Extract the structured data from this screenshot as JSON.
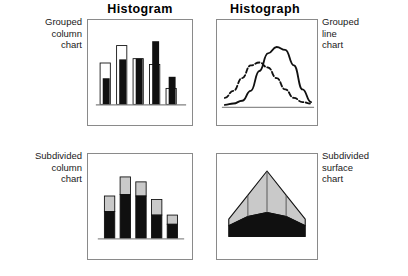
{
  "figure": {
    "headers": [
      {
        "id": "histogram",
        "label": "Histogram"
      },
      {
        "id": "histograph",
        "label": "Histograph"
      }
    ],
    "captions": {
      "grouped_column": "Grouped\ncolumn\nchart",
      "grouped_line": "Grouped\nline\nchart",
      "subdivided_column": "Subdivided\ncolumn\nchart",
      "subdivided_surface": "Subdivided\nsurface\nchart"
    },
    "colors": {
      "frame": "#8a8a8a",
      "ink": "#111111",
      "fill_dark": "#101010",
      "fill_light": "#ffffff",
      "fill_gray": "#c9c9c9",
      "background": "#ffffff"
    }
  },
  "chart_data": [
    {
      "id": "grouped-column-chart",
      "type": "bar",
      "title": "Grouped column chart",
      "xlabel": "",
      "ylabel": "",
      "grid": false,
      "legend": "none",
      "axis_baseline": true,
      "categories": [
        "1",
        "2",
        "3",
        "4",
        "5"
      ],
      "ylim": [
        0,
        100
      ],
      "series": [
        {
          "name": "white",
          "values": [
            57,
            81,
            63,
            55,
            22
          ]
        },
        {
          "name": "black",
          "values": [
            36,
            62,
            63,
            87,
            38
          ]
        }
      ]
    },
    {
      "id": "grouped-line-chart",
      "type": "line",
      "title": "Grouped line chart",
      "xlabel": "",
      "ylabel": "",
      "grid": false,
      "legend": "none",
      "axis_baseline": true,
      "xlim": [
        0,
        100
      ],
      "ylim": [
        0,
        100
      ],
      "series": [
        {
          "name": "dashed",
          "style": "dashed",
          "x": [
            0,
            10,
            20,
            30,
            40,
            50,
            60,
            70,
            80,
            90,
            100
          ],
          "y": [
            12,
            22,
            40,
            58,
            62,
            55,
            40,
            24,
            12,
            6,
            4
          ]
        },
        {
          "name": "solid",
          "style": "solid",
          "x": [
            0,
            10,
            20,
            30,
            40,
            50,
            60,
            70,
            80,
            90,
            100
          ],
          "y": [
            2,
            4,
            8,
            22,
            50,
            75,
            84,
            80,
            58,
            24,
            6
          ]
        }
      ]
    },
    {
      "id": "subdivided-column-chart",
      "type": "bar",
      "subtype": "stacked",
      "title": "Subdivided column chart",
      "xlabel": "",
      "ylabel": "",
      "grid": false,
      "legend": "none",
      "axis_baseline": true,
      "categories": [
        "1",
        "2",
        "3",
        "4",
        "5"
      ],
      "ylim": [
        0,
        100
      ],
      "series": [
        {
          "name": "lower-black",
          "values": [
            38,
            62,
            60,
            33,
            20
          ]
        },
        {
          "name": "upper-gray",
          "values": [
            22,
            25,
            20,
            22,
            13
          ]
        }
      ]
    },
    {
      "id": "subdivided-surface-chart",
      "type": "area",
      "subtype": "stacked",
      "title": "Subdivided surface chart",
      "xlabel": "",
      "ylabel": "",
      "grid": false,
      "legend": "none",
      "axis_baseline": true,
      "xlim": [
        0,
        100
      ],
      "ylim": [
        0,
        100
      ],
      "dividers_x": [
        25,
        50,
        75
      ],
      "series": [
        {
          "name": "lower-black",
          "x": [
            0,
            25,
            50,
            75,
            100
          ],
          "y": [
            16,
            30,
            36,
            30,
            16
          ]
        },
        {
          "name": "upper-gray",
          "x": [
            0,
            25,
            50,
            75,
            100
          ],
          "y": [
            10,
            32,
            62,
            32,
            10
          ]
        }
      ]
    }
  ]
}
